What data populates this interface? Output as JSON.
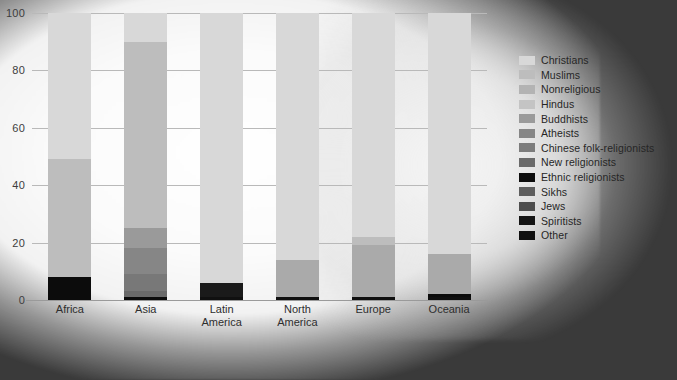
{
  "chart_data": {
    "type": "bar",
    "title": "",
    "subtitle": "",
    "stacked": true,
    "stack_mode": "percent",
    "xlabel": "",
    "ylabel": "",
    "ylim": [
      0,
      100
    ],
    "yticks": [
      0,
      20,
      40,
      60,
      80,
      100
    ],
    "ytick_labels": [
      "0",
      "20",
      "40",
      "60",
      "80",
      "100"
    ],
    "grid": true,
    "legend_position": "right",
    "categories": [
      "Africa",
      "Asia",
      "Latin America",
      "North America",
      "Europe",
      "Oceania"
    ],
    "category_labels": [
      [
        "Africa"
      ],
      [
        "Asia"
      ],
      [
        "Latin",
        "America"
      ],
      [
        "North",
        "America"
      ],
      [
        "Europe"
      ],
      [
        "Oceania"
      ]
    ],
    "series": [
      {
        "name": "Christians",
        "color": "#d8d8d8",
        "values": [
          51,
          10,
          94,
          86,
          78,
          84
        ]
      },
      {
        "name": "Muslims",
        "color": "#bdbdbd",
        "values": [
          41,
          65,
          0,
          0,
          3,
          0
        ]
      },
      {
        "name": "Nonreligious",
        "color": "#aaaaaa",
        "values": [
          0,
          0,
          0,
          13,
          18,
          14
        ]
      },
      {
        "name": "Hindus",
        "color": "#c4c4c4",
        "values": [
          0,
          0,
          0,
          0,
          0,
          0
        ]
      },
      {
        "name": "Buddhists",
        "color": "#9a9a9a",
        "values": [
          0,
          7,
          0,
          0,
          0,
          0
        ]
      },
      {
        "name": "Atheists",
        "color": "#868686",
        "values": [
          0,
          9,
          0,
          0,
          0,
          0
        ]
      },
      {
        "name": "Chinese folk-religionists",
        "color": "#787878",
        "values": [
          0,
          6,
          0,
          0,
          0,
          0
        ]
      },
      {
        "name": "New religionists",
        "color": "#6a6a6a",
        "values": [
          0,
          2,
          0,
          0,
          0,
          0
        ]
      },
      {
        "name": "Ethnic religionists",
        "color": "#0c0c0c",
        "values": [
          8,
          1,
          0,
          0,
          0,
          1
        ]
      },
      {
        "name": "Sikhs",
        "color": "#5c5c5c",
        "values": [
          0,
          0,
          0,
          0,
          0,
          0
        ]
      },
      {
        "name": "Jews",
        "color": "#4e4e4e",
        "values": [
          0,
          0,
          0,
          0,
          0,
          0
        ]
      },
      {
        "name": "Spiritists",
        "color": "#1a1a1a",
        "values": [
          0,
          0,
          5,
          0,
          0,
          0
        ]
      },
      {
        "name": "Other",
        "color": "#101010",
        "values": [
          0,
          0,
          1,
          1,
          1,
          1
        ]
      }
    ]
  },
  "legend": {
    "items": [
      {
        "label": "Christians",
        "swatch": "#d8d8d8"
      },
      {
        "label": "Muslims",
        "swatch": "#bdbdbd"
      },
      {
        "label": "Nonreligious",
        "swatch": "#b3b3b3"
      },
      {
        "label": "Hindus",
        "swatch": "#c4c4c4"
      },
      {
        "label": "Buddhists",
        "swatch": "#9a9a9a"
      },
      {
        "label": "Atheists",
        "swatch": "#868686"
      },
      {
        "label": "Chinese folk-religionists",
        "swatch": "#7c7c7c"
      },
      {
        "label": "New religionists",
        "swatch": "#6a6a6a"
      },
      {
        "label": "Ethnic religionists",
        "swatch": "#0c0c0c"
      },
      {
        "label": "Sikhs",
        "swatch": "#5e5e5e"
      },
      {
        "label": "Jews",
        "swatch": "#4e4e4e"
      },
      {
        "label": "Spiritists",
        "swatch": "#141414"
      },
      {
        "label": "Other",
        "swatch": "#101010"
      }
    ]
  },
  "colors": {
    "background": "#3a3a3a",
    "plot_blob": "#f4f4f4",
    "gridline": "#b9b9b9",
    "axis_text": "#303030"
  }
}
